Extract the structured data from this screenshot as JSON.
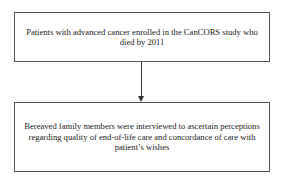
{
  "diagram": {
    "type": "flowchart",
    "nodes": [
      {
        "id": "step1",
        "text": "Patients with advanced cancer enrolled in the CanCORS study who died by 2011"
      },
      {
        "id": "step2",
        "text": "Bereaved family members were interviewed to ascertain perceptions regarding quality of end-of-life care and concordance of care with patient’s wishes"
      }
    ],
    "edges": [
      {
        "from": "step1",
        "to": "step2"
      }
    ]
  }
}
